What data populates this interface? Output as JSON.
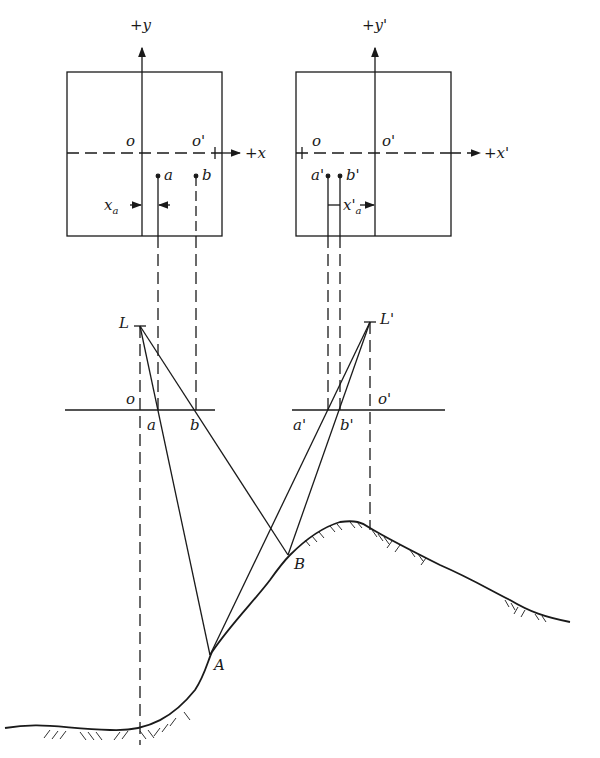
{
  "figure": {
    "type": "stereo-parallax-geometry",
    "left_photo": {
      "y_axis_label": "+y",
      "x_axis_label": "+x",
      "principal_point": "o",
      "conjugate_principal_point": "o'",
      "points": [
        "a",
        "b"
      ],
      "measurement_label": "x",
      "measurement_sub": "a"
    },
    "right_photo": {
      "y_axis_label": "+y'",
      "x_axis_label": "+x'",
      "principal_point": "o'",
      "conjugate_principal_point": "o",
      "points": [
        "a'",
        "b'"
      ],
      "measurement_label": "x'",
      "measurement_sub": "a"
    },
    "left_exposure": {
      "station": "L",
      "principal_point": "o",
      "image_points": [
        "a",
        "b"
      ]
    },
    "right_exposure": {
      "station": "L'",
      "principal_point": "o'",
      "image_points": [
        "a'",
        "b'"
      ]
    },
    "ground_points": [
      "A",
      "B"
    ],
    "colors": {
      "line": "#1a1a1a",
      "background": "#ffffff"
    }
  }
}
